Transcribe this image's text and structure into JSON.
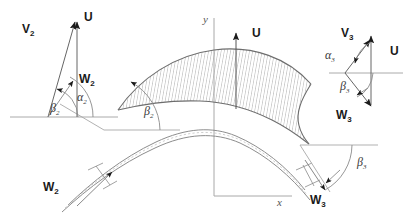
{
  "figure": {
    "colors": {
      "vector_stroke": "#555555",
      "blade_outline": "#666666",
      "hatch": "#9a9a9a",
      "axis": "#999999",
      "arc": "#8a8a8a",
      "text": "#1a1a1a"
    }
  },
  "axes": {
    "y_label": "y",
    "x_label": "x"
  },
  "inlet_triangle": {
    "name": "inlet velocity triangle",
    "vectors": [
      {
        "id": "V2",
        "label": "V",
        "sub": "2"
      },
      {
        "id": "U2",
        "label": "U",
        "sub": ""
      },
      {
        "id": "W2",
        "label": "W",
        "sub": "2"
      }
    ],
    "angles": [
      {
        "id": "alpha2",
        "label": "α",
        "sub": "2"
      },
      {
        "id": "beta2",
        "label": "β",
        "sub": "2"
      }
    ]
  },
  "outlet_triangle": {
    "name": "outlet velocity triangle",
    "vectors": [
      {
        "id": "V3",
        "label": "V",
        "sub": "3"
      },
      {
        "id": "U3",
        "label": "U",
        "sub": ""
      },
      {
        "id": "W3",
        "label": "W",
        "sub": "3"
      }
    ],
    "angles": [
      {
        "id": "alpha3",
        "label": "α",
        "sub": "3"
      },
      {
        "id": "beta3",
        "label": "β",
        "sub": "3"
      }
    ]
  },
  "cascade": {
    "blade_upper_name": "hatched blade passage",
    "blade_lower_name": "lower cascade blade",
    "u_label": "U",
    "inlet_flow": {
      "label": "W",
      "sub": "2"
    },
    "outlet_flow": {
      "label": "W",
      "sub": "3"
    },
    "inlet_angle": {
      "label": "β",
      "sub": "2"
    },
    "outlet_angle": {
      "label": "β",
      "sub": "3"
    }
  }
}
